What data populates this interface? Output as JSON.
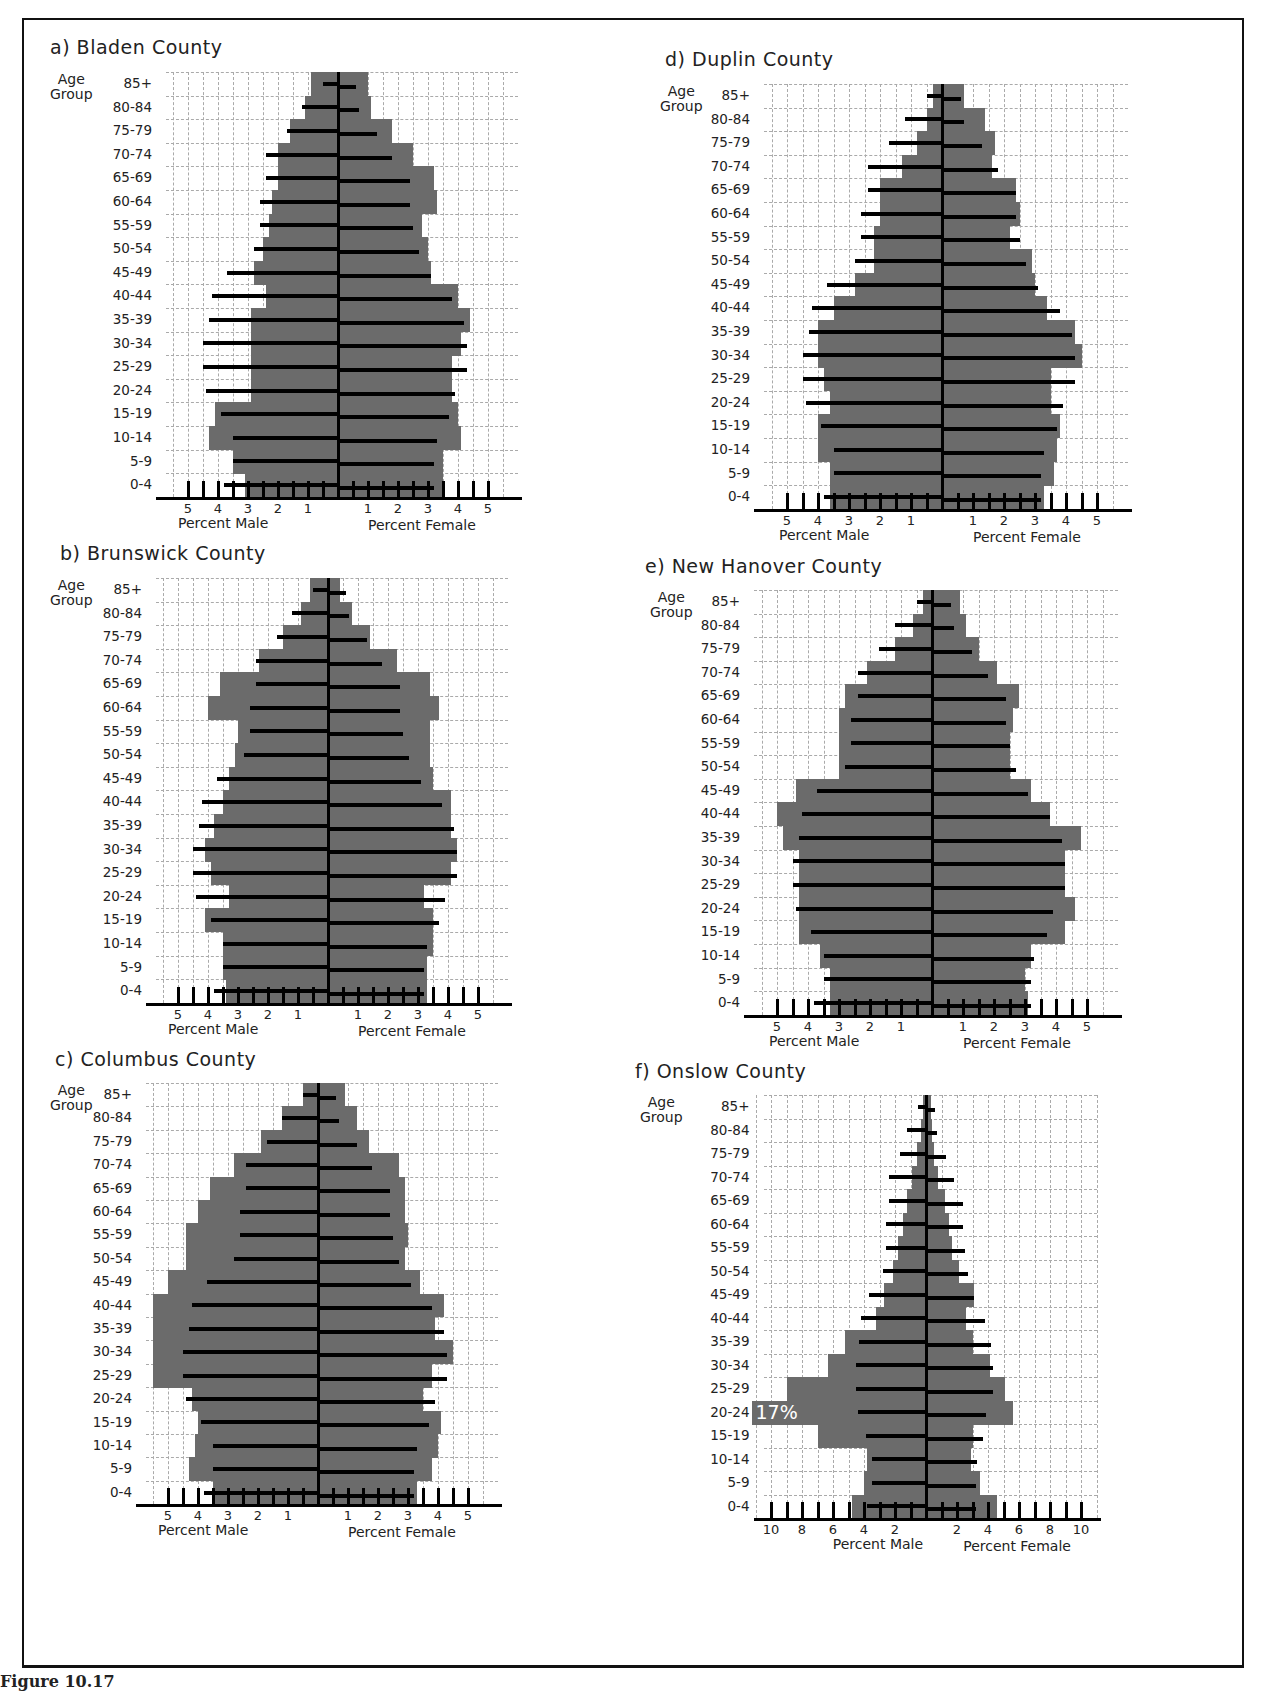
{
  "age_axis_title": "Age\nGroup",
  "x_axis": {
    "male_label": "Percent Male",
    "female_label": "Percent Female"
  },
  "caption": "Figure 10.17",
  "colors": {
    "county_bar": "#6b6b6b",
    "comparison_line": "#000000",
    "grid": "#aaaaaa"
  },
  "chart_data": [
    {
      "type": "bar",
      "subtype": "population-pyramid",
      "title": "a) Bladen County",
      "xlabel_left": "Percent Male",
      "xlabel_right": "Percent Female",
      "ylabel": "Age Group",
      "xlim": [
        -5,
        5
      ],
      "xticks": [
        5,
        4,
        3,
        2,
        1,
        1,
        2,
        3,
        4,
        5
      ],
      "categories": [
        "85+",
        "80-84",
        "75-79",
        "70-74",
        "65-69",
        "60-64",
        "55-59",
        "50-54",
        "45-49",
        "40-44",
        "35-39",
        "30-34",
        "25-29",
        "20-24",
        "15-19",
        "10-14",
        "5-9",
        "0-4"
      ],
      "series": [
        {
          "name": "County Male",
          "values": [
            0.9,
            1.1,
            1.6,
            2.0,
            2.0,
            2.2,
            2.3,
            2.5,
            2.8,
            2.4,
            2.9,
            2.9,
            2.9,
            2.9,
            4.1,
            4.3,
            3.5,
            3.1
          ]
        },
        {
          "name": "County Female",
          "values": [
            1.0,
            1.1,
            1.8,
            2.5,
            3.2,
            3.3,
            2.8,
            3.0,
            3.1,
            4.0,
            4.4,
            4.1,
            3.8,
            3.8,
            4.0,
            4.1,
            3.5,
            3.5
          ]
        },
        {
          "name": "Comparison Male",
          "values": [
            0.5,
            1.2,
            1.7,
            2.4,
            2.4,
            2.6,
            2.6,
            2.8,
            3.7,
            4.2,
            4.3,
            4.5,
            4.5,
            4.4,
            3.9,
            3.5,
            3.5,
            3.8
          ]
        },
        {
          "name": "Comparison Female",
          "values": [
            0.6,
            0.7,
            1.3,
            1.8,
            2.4,
            2.4,
            2.5,
            2.7,
            3.1,
            3.8,
            4.2,
            4.3,
            4.3,
            3.9,
            3.7,
            3.3,
            3.2,
            3.2
          ]
        }
      ]
    },
    {
      "type": "bar",
      "subtype": "population-pyramid",
      "title": "b) Brunswick County",
      "xlabel_left": "Percent Male",
      "xlabel_right": "Percent Female",
      "ylabel": "Age Group",
      "xlim": [
        -5,
        5
      ],
      "xticks": [
        5,
        4,
        3,
        2,
        1,
        1,
        2,
        3,
        4,
        5
      ],
      "categories": [
        "85+",
        "80-84",
        "75-79",
        "70-74",
        "65-69",
        "60-64",
        "55-59",
        "50-54",
        "45-49",
        "40-44",
        "35-39",
        "30-34",
        "25-29",
        "20-24",
        "15-19",
        "10-14",
        "5-9",
        "0-4"
      ],
      "series": [
        {
          "name": "County Male",
          "values": [
            0.6,
            0.9,
            1.5,
            2.3,
            3.6,
            4.0,
            3.0,
            3.1,
            3.3,
            3.5,
            3.8,
            4.1,
            3.9,
            3.3,
            4.1,
            3.5,
            3.5,
            3.4
          ]
        },
        {
          "name": "County Female",
          "values": [
            0.4,
            0.8,
            1.4,
            2.3,
            3.4,
            3.7,
            3.4,
            3.4,
            3.5,
            4.1,
            4.1,
            4.3,
            4.1,
            3.2,
            3.5,
            3.5,
            3.3,
            3.3
          ]
        },
        {
          "name": "Comparison Male",
          "values": [
            0.5,
            1.2,
            1.7,
            2.4,
            2.4,
            2.6,
            2.6,
            2.8,
            3.7,
            4.2,
            4.3,
            4.5,
            4.5,
            4.4,
            3.9,
            3.5,
            3.5,
            3.8
          ]
        },
        {
          "name": "Comparison Female",
          "values": [
            0.6,
            0.7,
            1.3,
            1.8,
            2.4,
            2.4,
            2.5,
            2.7,
            3.1,
            3.8,
            4.2,
            4.3,
            4.3,
            3.9,
            3.7,
            3.3,
            3.2,
            3.2
          ]
        }
      ]
    },
    {
      "type": "bar",
      "subtype": "population-pyramid",
      "title": "c) Columbus County",
      "xlabel_left": "Percent Male",
      "xlabel_right": "Percent Female",
      "ylabel": "Age Group",
      "xlim": [
        -5,
        5
      ],
      "xticks": [
        5,
        4,
        3,
        2,
        1,
        1,
        2,
        3,
        4,
        5
      ],
      "categories": [
        "85+",
        "80-84",
        "75-79",
        "70-74",
        "65-69",
        "60-64",
        "55-59",
        "50-54",
        "45-49",
        "40-44",
        "35-39",
        "30-34",
        "25-29",
        "20-24",
        "15-19",
        "10-14",
        "5-9",
        "0-4"
      ],
      "series": [
        {
          "name": "County Male",
          "values": [
            0.5,
            1.2,
            1.9,
            2.8,
            3.6,
            4.0,
            4.4,
            4.4,
            5.0,
            5.7,
            6.0,
            6.0,
            6.0,
            4.2,
            4.0,
            4.1,
            4.3,
            3.5
          ]
        },
        {
          "name": "County Female",
          "values": [
            0.9,
            1.3,
            1.7,
            2.7,
            2.9,
            2.9,
            3.0,
            2.9,
            3.4,
            4.2,
            3.9,
            4.5,
            3.8,
            3.5,
            4.1,
            4.0,
            3.8,
            3.3
          ]
        },
        {
          "name": "Comparison Male",
          "values": [
            0.5,
            1.2,
            1.7,
            2.4,
            2.4,
            2.6,
            2.6,
            2.8,
            3.7,
            4.2,
            4.3,
            4.5,
            4.5,
            4.4,
            3.9,
            3.5,
            3.5,
            3.8
          ]
        },
        {
          "name": "Comparison Female",
          "values": [
            0.6,
            0.7,
            1.3,
            1.8,
            2.4,
            2.4,
            2.5,
            2.7,
            3.1,
            3.8,
            4.2,
            4.3,
            4.3,
            3.9,
            3.7,
            3.3,
            3.2,
            3.2
          ]
        }
      ]
    },
    {
      "type": "bar",
      "subtype": "population-pyramid",
      "title": "d) Duplin County",
      "xlabel_left": "Percent Male",
      "xlabel_right": "Percent Female",
      "ylabel": "Age Group",
      "xlim": [
        -5,
        5
      ],
      "xticks": [
        5,
        4,
        3,
        2,
        1,
        1,
        2,
        3,
        4,
        5
      ],
      "categories": [
        "85+",
        "80-84",
        "75-79",
        "70-74",
        "65-69",
        "60-64",
        "55-59",
        "50-54",
        "45-49",
        "40-44",
        "35-39",
        "30-34",
        "25-29",
        "20-24",
        "15-19",
        "10-14",
        "5-9",
        "0-4"
      ],
      "series": [
        {
          "name": "County Male",
          "values": [
            0.3,
            0.5,
            0.8,
            1.3,
            2.0,
            2.0,
            2.2,
            2.2,
            2.8,
            3.5,
            4.0,
            4.0,
            3.8,
            3.6,
            4.0,
            4.0,
            3.6,
            3.6
          ]
        },
        {
          "name": "County Female",
          "values": [
            0.7,
            1.4,
            1.7,
            1.6,
            2.4,
            2.5,
            2.2,
            2.9,
            3.0,
            3.4,
            4.3,
            4.5,
            3.5,
            3.5,
            3.8,
            3.7,
            3.6,
            3.3
          ]
        },
        {
          "name": "Comparison Male",
          "values": [
            0.5,
            1.2,
            1.7,
            2.4,
            2.4,
            2.6,
            2.6,
            2.8,
            3.7,
            4.2,
            4.3,
            4.5,
            4.5,
            4.4,
            3.9,
            3.5,
            3.5,
            3.8
          ]
        },
        {
          "name": "Comparison Female",
          "values": [
            0.6,
            0.7,
            1.3,
            1.8,
            2.4,
            2.4,
            2.5,
            2.7,
            3.1,
            3.8,
            4.2,
            4.3,
            4.3,
            3.9,
            3.7,
            3.3,
            3.2,
            3.2
          ]
        }
      ]
    },
    {
      "type": "bar",
      "subtype": "population-pyramid",
      "title": "e) New Hanover County",
      "xlabel_left": "Percent Male",
      "xlabel_right": "Percent Female",
      "ylabel": "Age Group",
      "xlim": [
        -5,
        5
      ],
      "xticks": [
        5,
        4,
        3,
        2,
        1,
        1,
        2,
        3,
        4,
        5
      ],
      "categories": [
        "85+",
        "80-84",
        "75-79",
        "70-74",
        "65-69",
        "60-64",
        "55-59",
        "50-54",
        "45-49",
        "40-44",
        "35-39",
        "30-34",
        "25-29",
        "20-24",
        "15-19",
        "10-14",
        "5-9",
        "0-4"
      ],
      "series": [
        {
          "name": "County Male",
          "values": [
            0.3,
            0.6,
            1.2,
            2.1,
            2.8,
            3.0,
            3.0,
            3.0,
            4.4,
            5.0,
            4.8,
            4.3,
            4.3,
            4.3,
            4.3,
            3.6,
            3.3,
            3.3
          ]
        },
        {
          "name": "County Female",
          "values": [
            0.9,
            1.1,
            1.5,
            2.1,
            2.8,
            2.6,
            2.5,
            2.5,
            3.2,
            3.8,
            4.8,
            4.3,
            4.3,
            4.6,
            4.3,
            3.2,
            3.0,
            3.1
          ]
        },
        {
          "name": "Comparison Male",
          "values": [
            0.5,
            1.2,
            1.7,
            2.4,
            2.4,
            2.6,
            2.6,
            2.8,
            3.7,
            4.2,
            4.3,
            4.5,
            4.5,
            4.4,
            3.9,
            3.5,
            3.5,
            3.8
          ]
        },
        {
          "name": "Comparison Female",
          "values": [
            0.6,
            0.7,
            1.3,
            1.8,
            2.4,
            2.4,
            2.5,
            2.7,
            3.1,
            3.8,
            4.2,
            4.3,
            4.3,
            3.9,
            3.7,
            3.3,
            3.2,
            3.2
          ]
        }
      ]
    },
    {
      "type": "bar",
      "subtype": "population-pyramid",
      "title": "f) Onslow County",
      "xlabel_left": "Percent Male",
      "xlabel_right": "Percent Female",
      "ylabel": "Age Group",
      "xlim": [
        -11,
        11
      ],
      "xticks": [
        10,
        8,
        6,
        4,
        2,
        2,
        4,
        6,
        8,
        10
      ],
      "annotations": [
        {
          "text": "17%",
          "age_group": "20-24",
          "side": "male",
          "note": "bar truncated; actual male share 17%"
        }
      ],
      "categories": [
        "85+",
        "80-84",
        "75-79",
        "70-74",
        "65-69",
        "60-64",
        "55-59",
        "50-54",
        "45-49",
        "40-44",
        "35-39",
        "30-34",
        "25-29",
        "20-24",
        "15-19",
        "10-14",
        "5-9",
        "0-4"
      ],
      "series": [
        {
          "name": "County Male",
          "values": [
            0.2,
            0.3,
            0.6,
            0.9,
            1.2,
            1.5,
            1.8,
            2.1,
            2.7,
            3.2,
            5.2,
            6.3,
            9.0,
            17.0,
            7.0,
            3.8,
            4.0,
            4.8
          ]
        },
        {
          "name": "County Female",
          "values": [
            0.3,
            0.4,
            0.5,
            0.8,
            1.2,
            1.5,
            1.7,
            2.1,
            3.1,
            2.6,
            3.0,
            4.1,
            5.1,
            5.6,
            3.0,
            2.9,
            3.5,
            4.6
          ]
        },
        {
          "name": "Comparison Male",
          "values": [
            0.5,
            1.2,
            1.7,
            2.4,
            2.4,
            2.6,
            2.6,
            2.8,
            3.7,
            4.2,
            4.3,
            4.5,
            4.5,
            4.4,
            3.9,
            3.5,
            3.5,
            3.8
          ]
        },
        {
          "name": "Comparison Female",
          "values": [
            0.6,
            0.7,
            1.3,
            1.8,
            2.4,
            2.4,
            2.5,
            2.7,
            3.1,
            3.8,
            4.2,
            4.3,
            4.3,
            3.9,
            3.7,
            3.3,
            3.2,
            3.2
          ]
        }
      ]
    }
  ],
  "layout": [
    {
      "left": 30,
      "top": 36,
      "cx": 338,
      "plot_top": 72,
      "row_h": 23.6,
      "ppu": 30,
      "title_dx": 20
    },
    {
      "left": 30,
      "top": 542,
      "cx": 328,
      "plot_top": 578,
      "row_h": 23.6,
      "ppu": 30,
      "title_dx": 30
    },
    {
      "left": 30,
      "top": 1048,
      "cx": 318,
      "plot_top": 1083,
      "row_h": 23.4,
      "ppu": 30,
      "title_dx": 25
    },
    {
      "left": 640,
      "top": 48,
      "cx": 942,
      "plot_top": 84,
      "row_h": 23.6,
      "ppu": 31,
      "title_dx": 25
    },
    {
      "left": 630,
      "top": 555,
      "cx": 932,
      "plot_top": 590,
      "row_h": 23.6,
      "ppu": 31,
      "title_dx": 15
    },
    {
      "left": 620,
      "top": 1060,
      "cx": 926,
      "plot_top": 1095,
      "row_h": 23.5,
      "ppu": 15.5,
      "title_dx": 15
    }
  ]
}
